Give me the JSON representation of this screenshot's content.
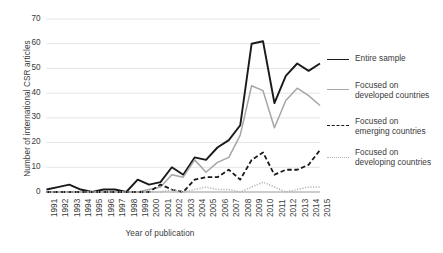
{
  "chart_data": {
    "type": "line",
    "title": "",
    "xlabel": "Year of publication",
    "ylabel": "Number of international CSR articles",
    "x": [
      1991,
      1992,
      1993,
      1994,
      1995,
      1996,
      1997,
      1998,
      1999,
      2000,
      2001,
      2002,
      2003,
      2004,
      2005,
      2006,
      2007,
      2008,
      2009,
      2010,
      2011,
      2012,
      2013,
      2014,
      2015
    ],
    "categories": [
      "1991",
      "1992",
      "1993",
      "1994",
      "1995",
      "1996",
      "1997",
      "1998",
      "1999",
      "2000",
      "2001",
      "2002",
      "2003",
      "2004",
      "2005",
      "2006",
      "2007",
      "2008",
      "2009",
      "2010",
      "2011",
      "2012",
      "2013",
      "2014",
      "2015"
    ],
    "xlim": [
      1991,
      2015
    ],
    "ylim": [
      0,
      70
    ],
    "yticks": [
      0,
      10,
      20,
      30,
      40,
      50,
      60,
      70
    ],
    "grid": "horizontal",
    "legend_position": "right",
    "series": [
      {
        "name": "Entire sample",
        "style": "solid",
        "color": "#1a1a1a",
        "width": 1.9,
        "values": [
          1,
          2,
          3,
          1,
          0,
          1,
          1,
          0,
          5,
          3,
          4,
          10,
          7,
          14,
          13,
          18,
          21,
          27,
          60,
          61,
          36,
          47,
          52,
          49,
          52
        ]
      },
      {
        "name": "Focused on\ndeveloped countries",
        "label_line1": "Focused on",
        "label_line2": "developed countries",
        "style": "solid",
        "color": "#a6a6a6",
        "width": 1.5,
        "values": [
          0,
          0,
          0,
          0,
          0,
          0,
          0,
          0,
          0,
          1,
          2,
          7,
          6,
          13,
          8,
          12,
          14,
          23,
          43,
          41,
          26,
          37,
          42,
          39,
          35
        ]
      },
      {
        "name": "Focused on\nemerging countries",
        "label_line1": "Focused on",
        "label_line2": "emerging countries",
        "style": "dashed",
        "color": "#1a1a1a",
        "width": 1.8,
        "values": [
          0,
          0,
          0,
          0,
          0,
          0,
          0,
          0,
          0,
          0,
          3,
          1,
          0,
          5,
          6,
          6,
          9,
          5,
          13,
          16,
          7,
          9,
          9,
          11,
          17
        ]
      },
      {
        "name": "Focused on\ndeveloping countries",
        "label_line1": "Focused on",
        "label_line2": "developing countries",
        "style": "dotted",
        "color": "#b3b3b3",
        "width": 1.5,
        "values": [
          0,
          0,
          0,
          0,
          0,
          0,
          0,
          0,
          0,
          0,
          0,
          1,
          0,
          1,
          2,
          1,
          1,
          0,
          2,
          4,
          2,
          0,
          1,
          2,
          2
        ]
      }
    ]
  },
  "legend": {
    "items": [
      {
        "label": "Entire sample",
        "line1": "Entire sample",
        "line2": ""
      },
      {
        "label": "Focused on developed countries",
        "line1": "Focused on",
        "line2": "developed countries"
      },
      {
        "label": "Focused on emerging countries",
        "line1": "Focused on",
        "line2": "emerging countries"
      },
      {
        "label": "Focused on developing countries",
        "line1": "Focused on",
        "line2": "developing countries"
      }
    ]
  }
}
